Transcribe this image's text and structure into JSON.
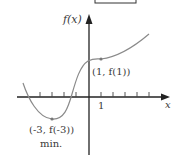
{
  "diagram": {
    "type": "function-graph",
    "y_axis_label": "f(x)",
    "x_axis_label": "x",
    "x_tick_label": "1",
    "points": [
      {
        "name": "local-max-inflection",
        "label": "(1, f(1))",
        "x": 1
      },
      {
        "name": "minimum",
        "label": "(-3, f(-3))",
        "sublabel": "min.",
        "x": -3
      }
    ],
    "colors": {
      "curve": "#8a8a8a",
      "axes": "#222222",
      "text": "#3a3a3a"
    }
  }
}
